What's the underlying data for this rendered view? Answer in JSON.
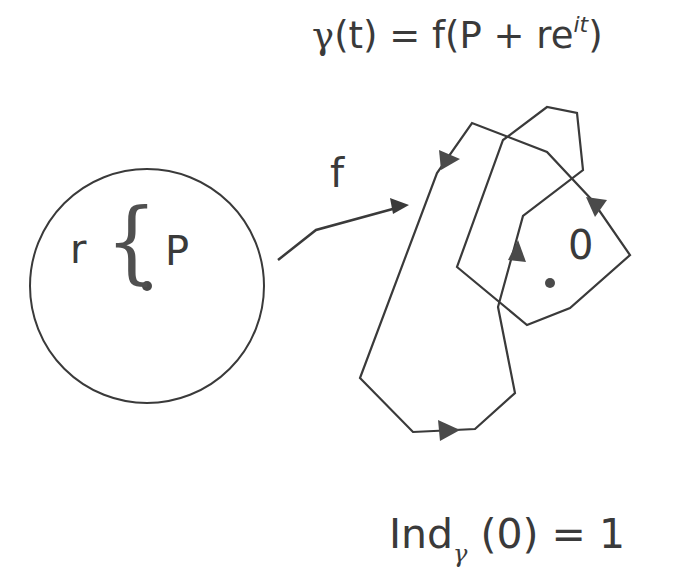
{
  "title_formula": {
    "gamma": "γ",
    "lhs_rest": "(t) = f(P + re",
    "exponent": "it",
    "close": ")"
  },
  "map_label": "f",
  "disk": {
    "radius_label": "r",
    "brace": "{",
    "center_label": "P",
    "center": [
      147,
      286
    ],
    "radius": 118
  },
  "image_curve": {
    "origin_label": "0",
    "origin_point": [
      550,
      283
    ],
    "points": [
      [
        413,
        432
      ],
      [
        475,
        429
      ],
      [
        515,
        393
      ],
      [
        498,
        307
      ],
      [
        523,
        216
      ],
      [
        583,
        170
      ],
      [
        577,
        113
      ],
      [
        547,
        107
      ],
      [
        503,
        140
      ],
      [
        457,
        267
      ],
      [
        527,
        325
      ],
      [
        570,
        308
      ],
      [
        630,
        255
      ],
      [
        592,
        200
      ],
      [
        547,
        152
      ],
      [
        472,
        123
      ],
      [
        437,
        173
      ],
      [
        360,
        378
      ]
    ]
  },
  "result_formula": {
    "ind": "Ind",
    "sub": "γ",
    "rest": " (0) = 1"
  },
  "colors": {
    "stroke": "#3a3a3a",
    "fill": "#4a4a4a"
  }
}
